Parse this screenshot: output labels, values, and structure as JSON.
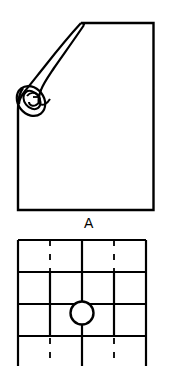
{
  "page": {
    "background_color": "#ffffff",
    "ink_color": "#000000",
    "width": 178,
    "height": 366
  },
  "figures": [
    {
      "id": "figure-a",
      "caption": "A",
      "description": "Rectangular sheet with rolled-up curled corner",
      "icon_name": "curled-sheet-icon",
      "outline": {
        "left": 17,
        "top": 22,
        "right": 154,
        "bottom": 211,
        "stroke_width": 2.2,
        "stroke_color": "#000000",
        "fill_color": "#ffffff"
      },
      "curl": {
        "name": "rolled-corner",
        "start_x": 81,
        "start_y": 23,
        "spiral_center_x": 32,
        "spiral_center_y": 101,
        "spiral_radius": 13,
        "stroke_width": 2.0
      }
    },
    {
      "id": "figure-b",
      "caption": "",
      "description": "Grid of cells with circular hole at center intersection",
      "icon_name": "grid-with-hole-icon",
      "grid": {
        "left": 18,
        "top": 240,
        "right": 146,
        "bottom": 366,
        "columns": 4,
        "rows": 4,
        "column_x": [
          18,
          50,
          82,
          114,
          146
        ],
        "row_y": [
          240,
          272,
          304,
          336,
          366
        ],
        "stroke_width": 2.0,
        "stroke_color": "#000000"
      },
      "dashed_verticals": {
        "name": "center-line-dashes",
        "x_positions": [
          50,
          114
        ],
        "dash_pattern": "5 7",
        "stroke_width": 1.6
      },
      "hole": {
        "name": "center-hole",
        "center_x": 82,
        "center_y": 313,
        "radius": 11.5,
        "stroke_width": 2.2,
        "fill_color": "#ffffff"
      }
    }
  ],
  "labels": {
    "figure_a_label": "A"
  }
}
